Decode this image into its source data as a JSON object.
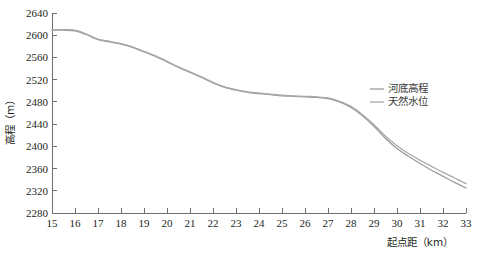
{
  "chart_data": {
    "type": "line",
    "title": "",
    "xlabel": "起点距（km）",
    "ylabel": "高程（m）",
    "xlim": [
      15,
      33
    ],
    "ylim": [
      2280,
      2640
    ],
    "xticks": [
      15,
      16,
      17,
      18,
      19,
      20,
      21,
      22,
      23,
      24,
      25,
      26,
      27,
      28,
      29,
      30,
      31,
      32,
      33
    ],
    "yticks": [
      2280,
      2320,
      2360,
      2400,
      2440,
      2480,
      2520,
      2560,
      2600,
      2640
    ],
    "grid": false,
    "legend_position": "right-middle",
    "x": [
      15,
      15.5,
      16,
      16.5,
      17,
      17.5,
      18,
      18.5,
      19,
      19.5,
      20,
      20.5,
      21,
      21.5,
      22,
      22.5,
      23,
      23.5,
      24,
      24.5,
      25,
      25.5,
      26,
      26.5,
      27,
      27.5,
      28,
      28.5,
      29,
      29.5,
      30,
      30.5,
      31,
      31.5,
      32,
      32.5,
      33
    ],
    "series": [
      {
        "name": "河底高程",
        "color": "#9c9c9c",
        "values": [
          2609,
          2609,
          2608,
          2601,
          2592,
          2588,
          2584,
          2578,
          2570,
          2562,
          2552,
          2542,
          2533,
          2524,
          2514,
          2506,
          2501,
          2497,
          2495,
          2493,
          2491,
          2490,
          2489,
          2488,
          2486,
          2480,
          2470,
          2455,
          2436,
          2414,
          2396,
          2382,
          2369,
          2357,
          2346,
          2335,
          2325
        ]
      },
      {
        "name": "天然水位",
        "color": "#a8a8a8",
        "values": [
          2610,
          2610,
          2609,
          2602,
          2593,
          2589,
          2585,
          2579,
          2571,
          2563,
          2553,
          2543,
          2534,
          2525,
          2515,
          2507,
          2502,
          2498,
          2496,
          2494,
          2492,
          2491,
          2490,
          2489,
          2487,
          2481,
          2472,
          2457,
          2439,
          2418,
          2401,
          2387,
          2375,
          2364,
          2353,
          2343,
          2333
        ]
      }
    ],
    "legend": [
      {
        "label": "河底高程",
        "color": "#9c9c9c"
      },
      {
        "label": "天然水位",
        "color": "#a8a8a8"
      }
    ],
    "colors": {
      "axis": "#6e6e6e",
      "text": "#231f20",
      "background": "#ffffff"
    }
  },
  "caption": {
    "text": ""
  }
}
